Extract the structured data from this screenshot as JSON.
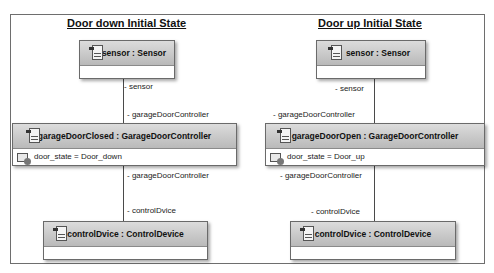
{
  "diagrams": [
    {
      "title": "Door down Initial State",
      "sensor": {
        "name": "sensor : Sensor"
      },
      "controller": {
        "name": "garageDoorClosed : GarageDoorController",
        "attribute": "door_state = Door_down"
      },
      "device": {
        "name": "controlDvice : ControlDevice"
      },
      "roles": {
        "sensor_end": "- sensor",
        "controller_top_end": "- garageDoorController",
        "controller_bottom_end": "- garageDoorController",
        "device_end": "- controlDvice"
      }
    },
    {
      "title": "Door up Initial State",
      "sensor": {
        "name": "sensor : Sensor"
      },
      "controller": {
        "name": "garageDoorOpen : GarageDoorController",
        "attribute": "door_state = Door_up"
      },
      "device": {
        "name": "controlDvice : ControlDevice"
      },
      "roles": {
        "sensor_end": "- sensor",
        "controller_top_end": "- garageDoorController",
        "controller_bottom_end": "- garageDoorController",
        "device_end": "- controlDvice"
      }
    }
  ],
  "icons": {
    "object": "class-instance-icon",
    "attribute": "attribute-slot-icon"
  },
  "colors": {
    "frame": "#6e6e6e",
    "header_top": "#dcdcdc",
    "header_bottom": "#b9b9b9",
    "line": "#4a4a4a"
  }
}
